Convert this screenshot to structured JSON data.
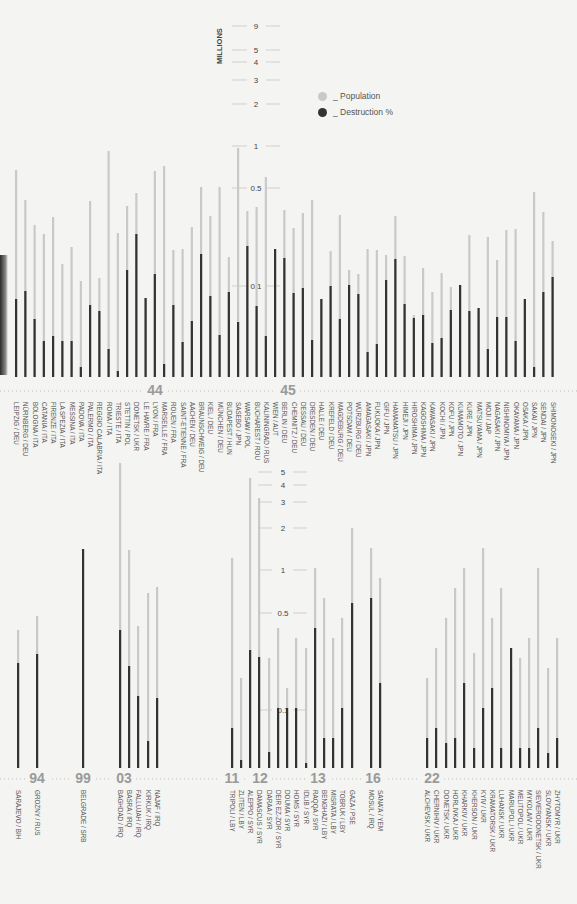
{
  "chart_data": [
    {
      "type": "bar",
      "title": "",
      "ylabel": "MILLIONS",
      "yscale": "log",
      "ytick_labels": [
        "9",
        "5",
        "4",
        "3",
        "2",
        "1",
        "0.5",
        "0.1"
      ],
      "legend": [
        {
          "name": "_ Population",
          "color": "#c8c8c8"
        },
        {
          "name": "_ Destruction %",
          "color": "#2e2e2e"
        }
      ],
      "year_markers": [
        {
          "label": "44",
          "after_index": 12
        },
        {
          "label": "45",
          "after_index": 28
        }
      ],
      "categories": [
        "LEIPZIG / DEU",
        "NÜRNBERG / DEU",
        "BOLOGNA / ITA",
        "CATANIA / ITA",
        "FIRENZE / ITA",
        "LA SPEZIA / ITA",
        "MESSINA / ITA",
        "PADOVA / ITA",
        "PALERMO / ITA",
        "REGGIO CALABRIA / ITA",
        "ROMA / ITA",
        "TRIESTE / ITA",
        "STETTIN / POL",
        "DONETSK / UKR",
        "LE HAVRE / FRA",
        "LYON / FRA",
        "MARSEILLE / FRA",
        "ROUEN / FRA",
        "SAINT-ETIENNE / FRA",
        "AACHEN / DEU",
        "BRAUNSCHWEIG / DEU",
        "KIEL / DEU",
        "MÜNCHEN / DEU",
        "BUDAPEST / HUN",
        "SASEBO / JPN",
        "WARSAW / POL",
        "BUCHAREST / ROU",
        "KALININGRAD / RUS",
        "WIEN / AUT",
        "BERLIN / DEU",
        "CHEMNITZ / DEU",
        "DESSAU / DEU",
        "DRESDEN / DEU",
        "HALLE / DEU",
        "KREFELD / DEU",
        "MAGDEBURG / DEU",
        "POTSDAM / DEU",
        "WÜRZBURG / DEU",
        "AMAGASAKI / JPN",
        "FUKUOKA / JPN",
        "GIFU / JPN",
        "HAMAMATSU / JPN",
        "HIMEJI / JPN",
        "HIROSHIMA / JPN",
        "KAGOSHIMA / JPN",
        "KAWASAKI / JPN",
        "KOCHI / JPN",
        "KOFU / JPN",
        "KUMAMOTO / JPN",
        "KURE / JPN",
        "MATSUYAMA / JPN",
        "MOJI / JAP",
        "NAGASAKI / JPN",
        "NISHINOMIYA / JPN",
        "OKAYAMA / JPN",
        "OSAKA / JPN",
        "SAKAI / JPN",
        "SENDAI / JPN",
        "SHIMONOSEKI / JPN"
      ],
      "series": [
        {
          "name": "Population (bar top, px from baseline)",
          "values": [
            207,
            177,
            152,
            143,
            160,
            113,
            130,
            96,
            176,
            99,
            226,
            144,
            171,
            184,
            79,
            206,
            211,
            127,
            128,
            150,
            190,
            161,
            190,
            120,
            229,
            166,
            170,
            200,
            128,
            167,
            149,
            164,
            177,
            78,
            126,
            162,
            107,
            103,
            128,
            127,
            122,
            161,
            121,
            62,
            109,
            85,
            104,
            90,
            92,
            142,
            69,
            140,
            117,
            147,
            148,
            78,
            185,
            165,
            136,
            130
          ],
          "unit": "px"
        },
        {
          "name": "Destruction % (bar top, px from baseline)",
          "values": [
            78,
            86,
            58,
            36,
            41,
            36,
            36,
            10,
            72,
            66,
            28,
            6,
            107,
            143,
            94,
            103,
            13,
            72,
            35,
            56,
            123,
            81,
            42,
            85,
            55,
            131,
            71,
            41,
            195,
            119,
            84,
            89,
            37,
            85,
            91,
            58,
            92,
            83,
            25,
            33,
            97,
            118,
            73,
            59,
            62,
            34,
            39,
            67,
            149,
            66,
            98,
            28,
            60,
            60,
            36,
            138,
            10,
            85,
            100,
            51,
            18,
            42
          ],
          "unit": "px"
        }
      ]
    },
    {
      "type": "bar",
      "title": "",
      "ylabel": "",
      "yscale": "log",
      "ytick_labels": [
        "5",
        "4",
        "3",
        "2",
        "1",
        "0.5",
        "0.1"
      ],
      "year_markers": [
        {
          "label": "94"
        },
        {
          "label": "99"
        },
        {
          "label": "03"
        },
        {
          "label": "11"
        },
        {
          "label": "12"
        },
        {
          "label": "13"
        },
        {
          "label": "16"
        },
        {
          "label": "22"
        }
      ],
      "categories": [
        "SARAJEVO / BIH",
        "GROZNY / RUS",
        "BELGRADE / SRB",
        "BAGHDAD / IRQ",
        "BASRA / IRQ",
        "FALLUJAH / IRQ",
        "KIRKUK / IRQ",
        "NAJAF / IRQ",
        "TRIPOLI / LBY",
        "ZLITEN / LBY",
        "ALEPPO / SYR",
        "DAMASCUS / SYR",
        "DARAA / SYR",
        "DEIR EZ-ZOR / SYR",
        "DOUMA / SYR",
        "HOMS / SYR",
        "IDLIB / SYR",
        "RAQQA / SYR",
        "BENGHAZI / LBY",
        "MISRATA / LBY",
        "TOBRUK / LBY",
        "GAZA / PSE",
        "MOSUL / IRQ",
        "SANA'A / YEM",
        "ALCHEVSK / UKR",
        "CHERNIHIV / UKR",
        "DONETSK / UKR",
        "HORLIVKA / UKR",
        "KHARKIV / UKR",
        "KHERSON / UKR",
        "KYIV / UKR",
        "KRAMATORSK / UKR",
        "LUHANSK / UKR",
        "MARIUPOL / UKR",
        "MELITOPOL / UKR",
        "MYKOLAIV / UKR",
        "SIEVIERODONETSK / UKR",
        "SLOVYANSK / UKR",
        "ZHYTOMYR / UKR"
      ],
      "series": [
        {
          "name": "Population (bar top, px from baseline)",
          "values": [
            138,
            152,
            0,
            305,
            218,
            142,
            175,
            181,
            210,
            90,
            290,
            270,
            110,
            140,
            80,
            130,
            120,
            200,
            170,
            130,
            150,
            240,
            220,
            190,
            90,
            120,
            150,
            180,
            200,
            115,
            220,
            150,
            180,
            100,
            110,
            130,
            200,
            100,
            130
          ],
          "unit": "px"
        },
        {
          "name": "Destruction % (bar top, px from baseline)",
          "values": [
            105,
            114,
            219,
            138,
            102,
            72,
            27,
            70,
            40,
            8,
            118,
            111,
            16,
            60,
            60,
            60,
            5,
            140,
            30,
            30,
            60,
            165,
            170,
            85,
            30,
            40,
            25,
            30,
            85,
            20,
            60,
            80,
            20,
            120,
            20,
            20,
            40,
            15,
            30
          ],
          "unit": "px"
        }
      ]
    }
  ],
  "legend": {
    "population": {
      "label": "_ Population",
      "color": "#c8c8c8"
    },
    "destruction": {
      "label": "_ Destruction %",
      "color": "#2e2e2e"
    }
  },
  "axis": {
    "title": "MILLIONS"
  },
  "colors": {
    "population": "#c9c9c9",
    "destruction": "#333333",
    "text": "#4a4a4a",
    "marker": "#9a9a9a",
    "bg": "#f4f4f2"
  }
}
